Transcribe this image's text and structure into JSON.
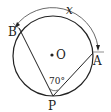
{
  "diagram": {
    "type": "circle-inscribed-angle",
    "center": {
      "label": "O"
    },
    "points": [
      {
        "label": "B"
      },
      {
        "label": "A"
      },
      {
        "label": "P"
      }
    ],
    "angle": {
      "vertex": "P",
      "value": "70°"
    },
    "arc": {
      "from": "B",
      "to": "A",
      "label": "x"
    },
    "colors": {
      "stroke": "#222222",
      "background": "#ffffff"
    }
  }
}
